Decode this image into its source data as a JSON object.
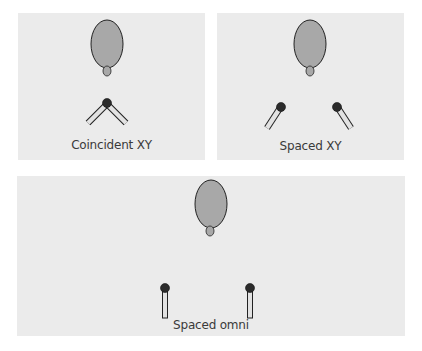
{
  "colors": {
    "panel_bg": "#ebebeb",
    "head_fill": "#a8a8a8",
    "outline": "#222222",
    "mic_body": "#e2e2e2",
    "mic_head": "#2b2b2b",
    "caption": "#3a3a3a"
  },
  "panels": [
    {
      "id": "coincident-xy",
      "caption": "Coincident XY",
      "mics": 2,
      "arrangement": "coincident, angled outward in X/Y"
    },
    {
      "id": "spaced-xy",
      "caption": "Spaced XY",
      "mics": 2,
      "arrangement": "spaced apart, angled inward"
    },
    {
      "id": "spaced-omni",
      "caption": "Spaced omni",
      "mics": 2,
      "arrangement": "spaced apart, pointing straight up"
    }
  ],
  "icons": {
    "head": "listener-head-icon",
    "nose": "nose-icon",
    "mic": "microphone-icon"
  }
}
